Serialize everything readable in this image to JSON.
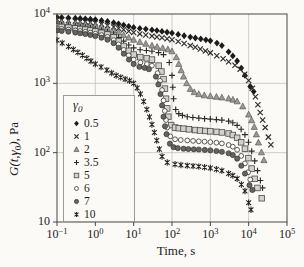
{
  "figure": {
    "background": "#fbfaf7",
    "frame_color": "#474744",
    "grid_color": "#c3c2bd",
    "x_axis": {
      "label": "Time, s",
      "ticks": [
        {
          "base": "10",
          "exp": "−1",
          "log": -1
        },
        {
          "base": "10",
          "exp": "0",
          "log": 0
        },
        {
          "base": "10",
          "exp": "1",
          "log": 1
        },
        {
          "base": "10",
          "exp": "2",
          "log": 2
        },
        {
          "base": "10",
          "exp": "3",
          "log": 3
        },
        {
          "base": "10",
          "exp": "4",
          "log": 4
        },
        {
          "base": "10",
          "exp": "5",
          "log": 5
        }
      ]
    },
    "y_axis": {
      "label_func": "G(t,",
      "label_gamma": "γ",
      "label_gamma_sub": "0",
      "label_close": "),",
      "label_unit": " Pa",
      "ticks": [
        {
          "base": "10",
          "exp": "4",
          "log": 4
        },
        {
          "base": "10",
          "exp": "3",
          "log": 3
        },
        {
          "base": "10",
          "exp": "2",
          "log": 2
        },
        {
          "base": "10",
          "exp": "",
          "log": 1
        }
      ]
    },
    "legend": {
      "title_gamma": "γ",
      "title_sub": "0"
    }
  },
  "chart_data": {
    "type": "scatter",
    "title": "",
    "xlabel": "Time, s",
    "ylabel": "G(t, γ0), Pa",
    "log_x": true,
    "log_y": true,
    "xlim": [
      0.1,
      100000
    ],
    "ylim": [
      10,
      10000
    ],
    "grid": true,
    "legend_position": "lower-left-inside",
    "legend_title": "γ0  (strain amplitude)",
    "series": [
      {
        "label": "0.5",
        "marker": "diamond-filled",
        "fill": "#1b1b1b",
        "stroke": "#111111",
        "points": [
          [
            0.1,
            9000
          ],
          [
            0.3,
            8700
          ],
          [
            1,
            8300
          ],
          [
            3,
            7500
          ],
          [
            10,
            6400
          ],
          [
            30,
            5900
          ],
          [
            100,
            5300
          ],
          [
            300,
            4650
          ],
          [
            1000,
            4100
          ],
          [
            2000,
            3500
          ],
          [
            3000,
            2850
          ],
          [
            5000,
            2100
          ],
          [
            8000,
            1300
          ],
          [
            11000,
            900
          ],
          [
            13500,
            760
          ]
        ]
      },
      {
        "label": "1",
        "marker": "x",
        "fill": "none",
        "stroke": "#2b2b2b",
        "points": [
          [
            0.1,
            8300
          ],
          [
            0.3,
            7900
          ],
          [
            1,
            7400
          ],
          [
            3,
            6500
          ],
          [
            10,
            5400
          ],
          [
            30,
            4800
          ],
          [
            100,
            4250
          ],
          [
            300,
            3500
          ],
          [
            1000,
            2750
          ],
          [
            3000,
            2050
          ],
          [
            6000,
            1600
          ],
          [
            10000,
            1100
          ],
          [
            15000,
            640
          ],
          [
            20000,
            380
          ],
          [
            27000,
            230
          ],
          [
            38000,
            130
          ]
        ]
      },
      {
        "label": "2",
        "marker": "triangle-filled",
        "fill": "#999996",
        "stroke": "#4c4c49",
        "points": [
          [
            0.1,
            7700
          ],
          [
            0.3,
            7300
          ],
          [
            1,
            6800
          ],
          [
            3,
            5800
          ],
          [
            10,
            4250
          ],
          [
            30,
            3500
          ],
          [
            100,
            2900
          ],
          [
            150,
            1900
          ],
          [
            200,
            1250
          ],
          [
            300,
            830
          ],
          [
            500,
            700
          ],
          [
            1000,
            655
          ],
          [
            2000,
            625
          ],
          [
            3000,
            605
          ],
          [
            5000,
            550
          ],
          [
            7000,
            465
          ],
          [
            10000,
            355
          ],
          [
            14000,
            235
          ],
          [
            18000,
            140
          ],
          [
            25000,
            78
          ]
        ]
      },
      {
        "label": "3.5",
        "marker": "plus",
        "fill": "none",
        "stroke": "#2b2b2b",
        "points": [
          [
            0.1,
            7100
          ],
          [
            0.3,
            6700
          ],
          [
            1,
            6100
          ],
          [
            3,
            5100
          ],
          [
            10,
            3250
          ],
          [
            30,
            2900
          ],
          [
            60,
            2600
          ],
          [
            85,
            2000
          ],
          [
            100,
            1300
          ],
          [
            110,
            600
          ],
          [
            125,
            420
          ],
          [
            150,
            365
          ],
          [
            250,
            330
          ],
          [
            500,
            315
          ],
          [
            1000,
            305
          ],
          [
            2000,
            295
          ],
          [
            3000,
            285
          ],
          [
            5000,
            248
          ],
          [
            8000,
            182
          ],
          [
            12000,
            105
          ],
          [
            17000,
            55
          ],
          [
            23000,
            31
          ]
        ]
      },
      {
        "label": "5",
        "marker": "square-light",
        "fill": "#d2d1cc",
        "stroke": "#4a4a47",
        "points": [
          [
            0.1,
            6600
          ],
          [
            0.3,
            6200
          ],
          [
            1,
            5600
          ],
          [
            3,
            4600
          ],
          [
            10,
            2600
          ],
          [
            30,
            2200
          ],
          [
            45,
            1800
          ],
          [
            60,
            1150
          ],
          [
            70,
            600
          ],
          [
            80,
            330
          ],
          [
            95,
            250
          ],
          [
            120,
            230
          ],
          [
            200,
            222
          ],
          [
            400,
            212
          ],
          [
            1000,
            203
          ],
          [
            2000,
            196
          ],
          [
            3000,
            189
          ],
          [
            5000,
            164
          ],
          [
            8000,
            114
          ],
          [
            12000,
            59
          ],
          [
            17000,
            31
          ],
          [
            22000,
            22
          ]
        ]
      },
      {
        "label": "6",
        "marker": "circle-open",
        "fill": "#fbfaf7",
        "stroke": "#4a4a47",
        "points": [
          [
            0.1,
            6200
          ],
          [
            0.3,
            5800
          ],
          [
            1,
            5200
          ],
          [
            3,
            4200
          ],
          [
            10,
            2200
          ],
          [
            30,
            1800
          ],
          [
            42,
            1400
          ],
          [
            55,
            800
          ],
          [
            65,
            400
          ],
          [
            75,
            230
          ],
          [
            90,
            172
          ],
          [
            120,
            156
          ],
          [
            250,
            150
          ],
          [
            500,
            146
          ],
          [
            1000,
            142
          ],
          [
            2000,
            136
          ],
          [
            3000,
            129
          ],
          [
            5000,
            110
          ],
          [
            8000,
            70
          ],
          [
            11000,
            41
          ]
        ]
      },
      {
        "label": "7",
        "marker": "circle-filled",
        "fill": "#646461",
        "stroke": "#2d2d2b",
        "points": [
          [
            0.1,
            5800
          ],
          [
            0.3,
            5400
          ],
          [
            1,
            4800
          ],
          [
            3,
            3800
          ],
          [
            10,
            1900
          ],
          [
            25,
            1600
          ],
          [
            38,
            1250
          ],
          [
            50,
            700
          ],
          [
            60,
            330
          ],
          [
            72,
            185
          ],
          [
            88,
            135
          ],
          [
            110,
            120
          ],
          [
            200,
            114
          ],
          [
            500,
            111
          ],
          [
            1000,
            108
          ],
          [
            2000,
            103
          ],
          [
            3000,
            98
          ],
          [
            5000,
            82
          ],
          [
            8000,
            50
          ],
          [
            10500,
            34
          ],
          [
            12500,
            29
          ]
        ]
      },
      {
        "label": "10",
        "marker": "star",
        "fill": "none",
        "stroke": "#232323",
        "points": [
          [
            0.1,
            4200
          ],
          [
            0.2,
            3400
          ],
          [
            0.35,
            2800
          ],
          [
            0.6,
            2300
          ],
          [
            1,
            1900
          ],
          [
            2,
            1550
          ],
          [
            3.5,
            1300
          ],
          [
            6,
            1150
          ],
          [
            10,
            1000
          ],
          [
            15,
            700
          ],
          [
            22,
            420
          ],
          [
            30,
            255
          ],
          [
            40,
            150
          ],
          [
            55,
            88
          ],
          [
            75,
            72
          ],
          [
            120,
            68
          ],
          [
            250,
            65
          ],
          [
            500,
            63
          ],
          [
            1000,
            60
          ],
          [
            2000,
            55
          ],
          [
            3000,
            50
          ],
          [
            5000,
            42
          ],
          [
            8000,
            28
          ],
          [
            10000,
            19
          ],
          [
            11500,
            15
          ]
        ]
      }
    ]
  }
}
